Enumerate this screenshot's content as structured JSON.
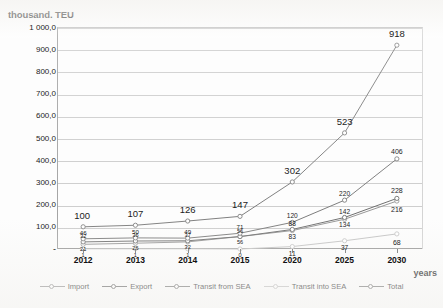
{
  "chart_data": {
    "type": "line",
    "title": "thousand. TEU",
    "xlabel": "years",
    "ylabel": "thousand. TEU",
    "categories": [
      "2012",
      "2013",
      "2014",
      "2015",
      "2020",
      "2025",
      "2030"
    ],
    "ylim": [
      0,
      1000
    ],
    "yticks": [
      "-",
      "100,0",
      "200,0",
      "300,0",
      "400,0",
      "500,0",
      "600,0",
      "700,0",
      "800,0",
      "900,0",
      "1 000,0"
    ],
    "ytick_values": [
      0,
      100,
      200,
      300,
      400,
      500,
      600,
      700,
      800,
      900,
      1000
    ],
    "grid": true,
    "legend_position": "bottom",
    "series": [
      {
        "name": "Import",
        "color": "#8c8c8c",
        "values": [
          21,
          26,
          32,
          56,
          83,
          134,
          216
        ],
        "labels": [
          "21",
          "26",
          "32",
          "56",
          "83",
          "134",
          "216"
        ]
      },
      {
        "name": "Export",
        "color": "#5f5f5f",
        "values": [
          32,
          36,
          37,
          56,
          88,
          142,
          228
        ],
        "labels": [
          "32",
          "36",
          "37",
          "56",
          "88",
          "142",
          "228"
        ]
      },
      {
        "name": "Transit from SEA",
        "color": "#6e6e6e",
        "values": [
          46,
          50,
          49,
          71,
          120,
          220,
          406
        ],
        "labels": [
          "46",
          "50",
          "49",
          "71",
          "120",
          "220",
          "406"
        ]
      },
      {
        "name": "Transit into SEA",
        "color": "#bdbdbd",
        "values": [
          1,
          1,
          1,
          0,
          11,
          37,
          68
        ],
        "labels": [
          "1",
          "1",
          "1",
          "0",
          "11",
          "37",
          "68"
        ]
      },
      {
        "name": "Total",
        "color": "#707070",
        "values": [
          100,
          107,
          126,
          147,
          302,
          523,
          918
        ],
        "labels": [
          "100",
          "107",
          "126",
          "147",
          "302",
          "523",
          "918"
        ]
      }
    ]
  },
  "legend": {
    "items": [
      {
        "label": "Import"
      },
      {
        "label": "Export"
      },
      {
        "label": "Transit from SEA"
      },
      {
        "label": "Transit into SEA"
      },
      {
        "label": "Total"
      }
    ]
  }
}
